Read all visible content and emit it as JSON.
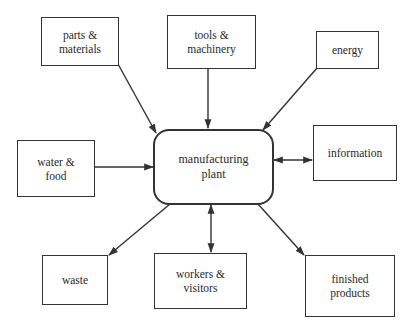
{
  "diagram": {
    "title_cropped": "",
    "center": {
      "line1": "manufacturing",
      "line2": "plant"
    },
    "nodes": {
      "parts_materials": {
        "line1": "parts &",
        "line2": "materials",
        "direction": "input"
      },
      "tools_machinery": {
        "line1": "tools &",
        "line2": "machinery",
        "direction": "input"
      },
      "energy": {
        "line1": "energy",
        "direction": "input"
      },
      "water_food": {
        "line1": "water &",
        "line2": "food",
        "direction": "input"
      },
      "information": {
        "line1": "information",
        "direction": "bidirectional"
      },
      "waste": {
        "line1": "waste",
        "direction": "output"
      },
      "workers_visitors": {
        "line1": "workers &",
        "line2": "visitors",
        "direction": "bidirectional"
      },
      "finished_products": {
        "line1": "finished",
        "line2": "products",
        "direction": "output"
      }
    },
    "colors": {
      "line": "#333333",
      "background": "#ffffff"
    }
  }
}
